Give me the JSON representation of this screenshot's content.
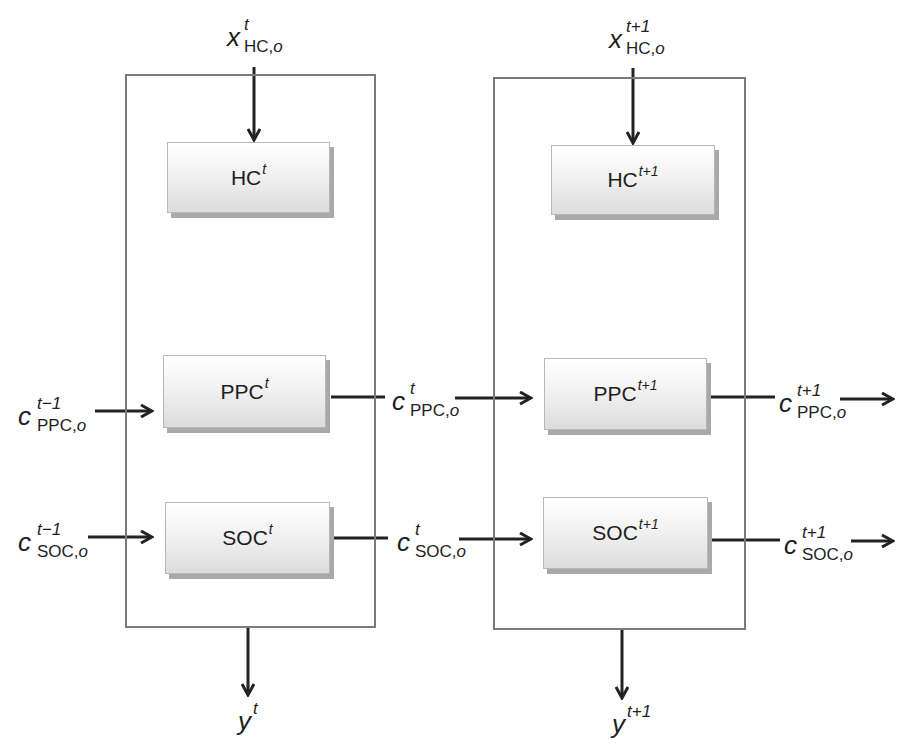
{
  "diagram": {
    "type": "unrolled-recurrent-block-diagram",
    "colors": {
      "frame_border": "#7a7a7a",
      "arrow": "#222222",
      "node_gradient_top": "#ffffff",
      "node_gradient_bottom": "#dcdcdc",
      "node_shadow": "#a9a9a9"
    },
    "timesteps": [
      {
        "id": "t",
        "nodes": {
          "hc": {
            "name": "HC",
            "sup": "t"
          },
          "ppc": {
            "name": "PPC",
            "sup": "t"
          },
          "soc": {
            "name": "SOC",
            "sup": "t"
          }
        },
        "input_top": {
          "base": "x",
          "sup": "t",
          "sub": "HC,",
          "sub_it": "o"
        },
        "output_bottom": {
          "base": "y",
          "sup": "t"
        },
        "input_ppc": {
          "base": "c",
          "sup": "t−1",
          "sub": "PPC,",
          "sub_it": "o"
        },
        "input_soc": {
          "base": "c",
          "sup": "t−1",
          "sub": "SOC,",
          "sub_it": "o"
        },
        "output_ppc": {
          "base": "c",
          "sup": "t",
          "sub": "PPC,",
          "sub_it": "o"
        },
        "output_soc": {
          "base": "c",
          "sup": "t",
          "sub": "SOC,",
          "sub_it": "o"
        }
      },
      {
        "id": "t+1",
        "nodes": {
          "hc": {
            "name": "HC",
            "sup": "t+1"
          },
          "ppc": {
            "name": "PPC",
            "sup": "t+1"
          },
          "soc": {
            "name": "SOC",
            "sup": "t+1"
          }
        },
        "input_top": {
          "base": "x",
          "sup": "t+1",
          "sub": "HC,",
          "sub_it": "o"
        },
        "output_bottom": {
          "base": "y",
          "sup": "t+1"
        },
        "output_ppc": {
          "base": "c",
          "sup": "t+1",
          "sub": "PPC,",
          "sub_it": "o"
        },
        "output_soc": {
          "base": "c",
          "sup": "t+1",
          "sub": "SOC,",
          "sub_it": "o"
        }
      }
    ]
  }
}
